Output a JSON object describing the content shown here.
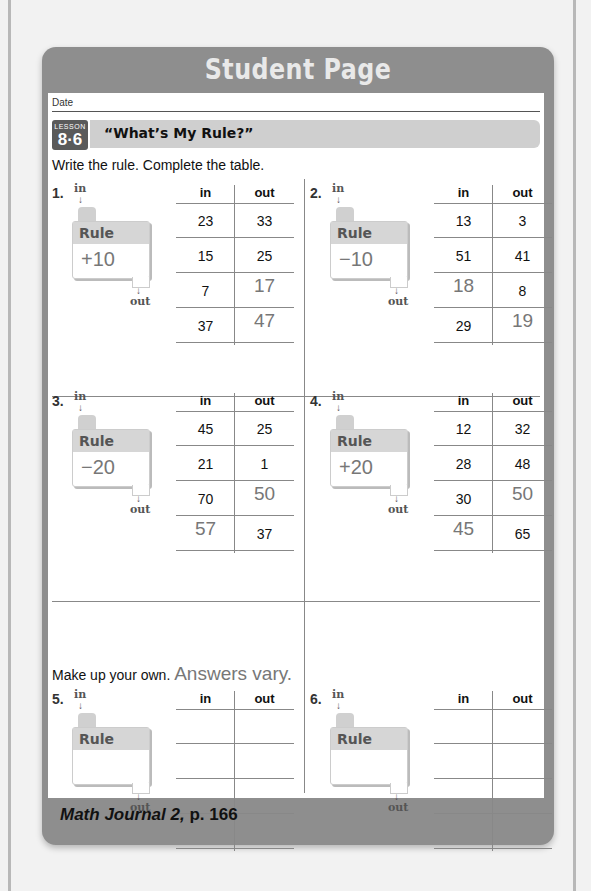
{
  "header": {
    "title": "Student Page"
  },
  "sheet": {
    "date_label": "Date",
    "lesson": {
      "word": "LESSON",
      "number": "8·6",
      "title": "“What’s My Rule?”"
    },
    "instructions": "Write the rule. Complete the table.",
    "table_headers": {
      "in": "in",
      "out": "out"
    },
    "machine_labels": {
      "in": "in",
      "out": "out",
      "rule": "Rule",
      "arrow": "↓"
    },
    "problems": [
      {
        "number": "1.",
        "rule": "+10",
        "rows": [
          {
            "in": "23",
            "out": "33",
            "in_hand": false,
            "out_hand": false
          },
          {
            "in": "15",
            "out": "25",
            "in_hand": false,
            "out_hand": false
          },
          {
            "in": "7",
            "out": "17",
            "in_hand": false,
            "out_hand": true
          },
          {
            "in": "37",
            "out": "47",
            "in_hand": false,
            "out_hand": true
          }
        ]
      },
      {
        "number": "2.",
        "rule": "−10",
        "rows": [
          {
            "in": "13",
            "out": "3"
          },
          {
            "in": "51",
            "out": "41"
          },
          {
            "in": "18",
            "out": "8"
          },
          {
            "in": "29",
            "out": "19"
          }
        ]
      },
      {
        "number": "3.",
        "rule": "−20",
        "rows": [
          {
            "in": "45",
            "out": "25"
          },
          {
            "in": "21",
            "out": "1"
          },
          {
            "in": "70",
            "out": "50"
          },
          {
            "in": "57",
            "out": "37"
          }
        ]
      },
      {
        "number": "4.",
        "rule": "+20",
        "rows": [
          {
            "in": "12",
            "out": "32"
          },
          {
            "in": "28",
            "out": "48"
          },
          {
            "in": "30",
            "out": "50"
          },
          {
            "in": "45",
            "out": "65"
          }
        ]
      },
      {
        "number": "5.",
        "rule": "",
        "rows": [
          {
            "in": "",
            "out": ""
          },
          {
            "in": "",
            "out": ""
          },
          {
            "in": "",
            "out": ""
          },
          {
            "in": "",
            "out": ""
          }
        ]
      },
      {
        "number": "6.",
        "rule": "",
        "rows": [
          {
            "in": "",
            "out": ""
          },
          {
            "in": "",
            "out": ""
          },
          {
            "in": "",
            "out": ""
          },
          {
            "in": "",
            "out": ""
          }
        ]
      }
    ],
    "make_your_own": "Make up your own.",
    "answers_vary": "Answers vary."
  },
  "footer": {
    "book": "Math Journal 2,",
    "page": "p. 166"
  }
}
